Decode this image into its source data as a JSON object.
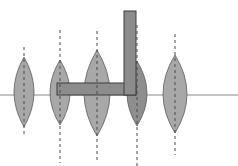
{
  "diagram": {
    "colors": {
      "background": "#ffffff",
      "axis": "#8a8a8a",
      "lens_fill": "#a8a8a8",
      "lens_fill_dark": "#8e8e8e",
      "lens_stroke": "#5a5a5a",
      "dash": "#4a4a4a",
      "object_fill": "#8c8c8c",
      "object_stroke": "#3c3c3c"
    },
    "axis": {
      "y": 95,
      "x1": 0,
      "x2": 238
    },
    "lenses": [
      {
        "id": 1,
        "cx": 24,
        "top": 57,
        "bottom": 127,
        "half_width": 10,
        "dash_top": 47,
        "dash_bottom": 136,
        "shade": "normal"
      },
      {
        "id": 2,
        "cx": 60,
        "top": 60,
        "bottom": 125,
        "half_width": 10,
        "dash_top": 30,
        "dash_bottom": 163,
        "shade": "normal"
      },
      {
        "id": 3,
        "cx": 97,
        "top": 50,
        "bottom": 136,
        "half_width": 13,
        "dash_top": 31,
        "dash_bottom": 163,
        "shade": "normal"
      },
      {
        "id": 4,
        "cx": 137,
        "top": 61,
        "bottom": 126,
        "half_width": 10,
        "dash_top": 25,
        "dash_bottom": 166,
        "shade": "dark"
      },
      {
        "id": 5,
        "cx": 175,
        "top": 55,
        "bottom": 133,
        "half_width": 12,
        "dash_top": 34,
        "dash_bottom": 155,
        "shade": "normal"
      }
    ],
    "object": {
      "vertical_bar": {
        "x": 124,
        "y": 11,
        "w": 12,
        "h": 84
      },
      "horizontal_bar": {
        "x": 57,
        "y": 83,
        "w": 79,
        "h": 12
      }
    }
  }
}
